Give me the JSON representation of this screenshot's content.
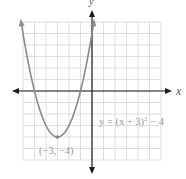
{
  "chart_data": {
    "type": "line",
    "title": "",
    "xlabel": "x",
    "ylabel": "y",
    "xlim": [
      -6,
      6
    ],
    "ylim": [
      -6,
      6
    ],
    "grid": true,
    "equation": "y = (x + 3)² − 4",
    "series": [
      {
        "name": "y = (x+3)^2 - 4",
        "x": [
          -6.16,
          -6,
          -5.5,
          -5,
          -4.5,
          -4,
          -3.5,
          -3,
          -2.5,
          -2,
          -1.5,
          -1,
          -0.5,
          0,
          0.16
        ],
        "y": [
          6,
          5,
          2.25,
          0,
          -1.75,
          -3,
          -3.75,
          -4,
          -3.75,
          -3,
          -1.75,
          0,
          2.25,
          5,
          6
        ]
      }
    ],
    "annotations": [
      {
        "text": "(−3, −4)",
        "x": -3,
        "y": -4,
        "type": "vertex"
      },
      {
        "text": "y = (x + 3)² − 4",
        "type": "equation-label"
      }
    ],
    "colors": {
      "curve": "#8a8a8a",
      "grid": "#d6d6d6",
      "axes": "#1a1a1a",
      "label": "#9a9a9a"
    }
  },
  "labels": {
    "x_axis": "x",
    "y_axis": "y",
    "vertex": "(−3, −4)",
    "equation_main": "y = (x + 3)",
    "equation_exp": "2",
    "equation_tail": " − 4"
  }
}
